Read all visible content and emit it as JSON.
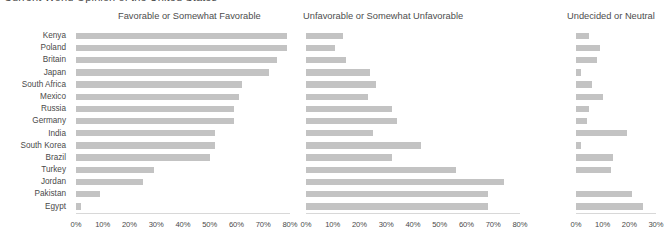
{
  "suptitle": "Current World Opinion of the United States",
  "panels": [
    {
      "id": "favorable",
      "title": "Favorable or Somewhat Favorable",
      "xmax": 80,
      "ticks": [
        "0%",
        "10%",
        "20%",
        "30%",
        "40%",
        "50%",
        "60%",
        "70%",
        "80%"
      ]
    },
    {
      "id": "unfavorable",
      "title": "Unfavorable or Somewhat Unfavorable",
      "xmax": 80,
      "ticks": [
        "0%",
        "10%",
        "20%",
        "30%",
        "40%",
        "50%",
        "60%",
        "70%",
        "80%"
      ]
    },
    {
      "id": "undecided",
      "title": "Undecided or Neutral",
      "xmax": 30,
      "ticks": [
        "0%",
        "10%",
        "20%",
        "30%"
      ]
    }
  ],
  "colors": {
    "bar": "#c3c3c3",
    "axis": "#d8d8d8",
    "text": "#4a4a4a",
    "background": "#ffffff"
  },
  "chart_data": {
    "type": "bar",
    "title": "Current World Opinion of the United States",
    "xlabel": "",
    "ylabel": "",
    "orientation": "horizontal",
    "grid": false,
    "legend": "none",
    "categories": [
      "Kenya",
      "Poland",
      "Britain",
      "Japan",
      "South Africa",
      "Mexico",
      "Russia",
      "Germany",
      "India",
      "South Korea",
      "Brazil",
      "Turkey",
      "Jordan",
      "Pakistan",
      "Egypt"
    ],
    "panels": [
      {
        "name": "Favorable or Somewhat Favorable",
        "xlim": [
          0,
          80
        ],
        "values": [
          79,
          79,
          75,
          72,
          62,
          61,
          59,
          59,
          52,
          52,
          50,
          29,
          25,
          9,
          2
        ]
      },
      {
        "name": "Unfavorable or Somewhat Unfavorable",
        "xlim": [
          0,
          80
        ],
        "values": [
          14,
          11,
          15,
          24,
          26,
          23,
          32,
          34,
          25,
          43,
          32,
          56,
          74,
          68,
          68
        ]
      },
      {
        "name": "Undecided or Neutral",
        "xlim": [
          0,
          30
        ],
        "values": [
          5,
          9,
          8,
          2,
          6,
          10,
          5,
          4,
          19,
          2,
          14,
          13,
          0,
          21,
          25
        ]
      }
    ]
  }
}
